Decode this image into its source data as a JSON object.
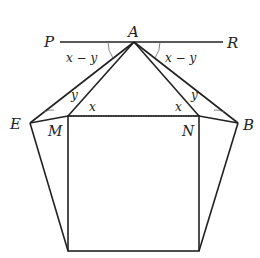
{
  "diagram": {
    "points": {
      "P": {
        "label": "P",
        "x": 60,
        "y": 42
      },
      "A": {
        "label": "A",
        "x": 134,
        "y": 42
      },
      "R": {
        "label": "R",
        "x": 223,
        "y": 42
      },
      "E": {
        "label": "E",
        "x": 30,
        "y": 123
      },
      "M": {
        "label": "M",
        "x": 68,
        "y": 116
      },
      "N": {
        "label": "N",
        "x": 199,
        "y": 116
      },
      "B": {
        "label": "B",
        "x": 238,
        "y": 123
      },
      "BL": {
        "label": "",
        "x": 68,
        "y": 251
      },
      "BR": {
        "label": "",
        "x": 199,
        "y": 251
      }
    },
    "angle_labels": {
      "left_top": "x − y",
      "right_top": "x − y",
      "left_y": "y",
      "left_x": "x",
      "right_x": "x",
      "right_y": "y"
    }
  }
}
